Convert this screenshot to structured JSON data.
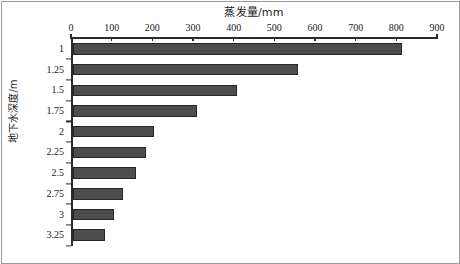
{
  "chart_data": {
    "type": "bar",
    "orientation": "horizontal",
    "title": "",
    "xlabel": "蒸发量/mm",
    "ylabel": "地下水深度/m",
    "categories": [
      "1",
      "1.25",
      "1.5",
      "1.75",
      "2",
      "2.25",
      "2.5",
      "2.75",
      "3",
      "3.25"
    ],
    "values": [
      810,
      555,
      405,
      305,
      200,
      180,
      155,
      125,
      103,
      80
    ],
    "xlim": [
      0,
      900
    ],
    "xticks": [
      0,
      100,
      200,
      300,
      400,
      500,
      600,
      700,
      800,
      900
    ],
    "xtick_labels": [
      "0",
      "100",
      "200",
      "300",
      "400",
      "500",
      "600",
      "700",
      "800",
      "900"
    ],
    "grid": false,
    "legend": null,
    "bar_color": "#4d4d4d",
    "bar_edge_color": "#262626",
    "axis_color": "#2b2b2b",
    "frame_color": "#9a9a9a",
    "x_axis_position": "top",
    "y_axis_direction": "downward"
  }
}
